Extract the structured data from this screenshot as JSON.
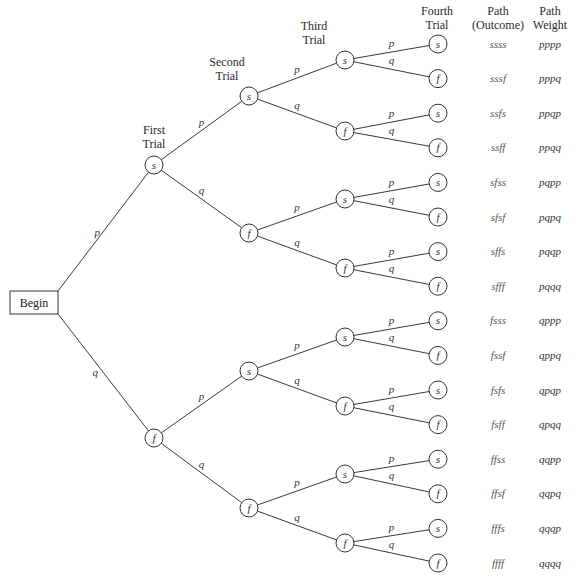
{
  "begin": {
    "label": "Begin"
  },
  "headers": {
    "first_trial": [
      "First",
      "Trial"
    ],
    "second_trial": [
      "Second",
      "Trial"
    ],
    "third_trial": [
      "Third",
      "Trial"
    ],
    "fourth_trial": [
      "Fourth",
      "Trial"
    ],
    "path_outcome": [
      "Path",
      "(Outcome)"
    ],
    "path_weight": [
      "Path",
      "Weight"
    ]
  },
  "edge_labels": {
    "success": "p",
    "failure": "q"
  },
  "node_labels": {
    "success": "s",
    "failure": "f"
  },
  "paths": [
    {
      "outcome": "ssss",
      "weight": "pppp"
    },
    {
      "outcome": "sssf",
      "weight": "pppq"
    },
    {
      "outcome": "ssfs",
      "weight": "ppqp"
    },
    {
      "outcome": "ssff",
      "weight": "ppqq"
    },
    {
      "outcome": "sfss",
      "weight": "pqpp"
    },
    {
      "outcome": "sfsf",
      "weight": "pqpq"
    },
    {
      "outcome": "sffs",
      "weight": "pqqp"
    },
    {
      "outcome": "sfff",
      "weight": "pqqq"
    },
    {
      "outcome": "fsss",
      "weight": "qppp"
    },
    {
      "outcome": "fssf",
      "weight": "qppq"
    },
    {
      "outcome": "fsfs",
      "weight": "qpqp"
    },
    {
      "outcome": "fsff",
      "weight": "qpqq"
    },
    {
      "outcome": "ffss",
      "weight": "qqpp"
    },
    {
      "outcome": "ffsf",
      "weight": "qqpq"
    },
    {
      "outcome": "fffs",
      "weight": "qqqp"
    },
    {
      "outcome": "ffff",
      "weight": "qqqq"
    }
  ]
}
